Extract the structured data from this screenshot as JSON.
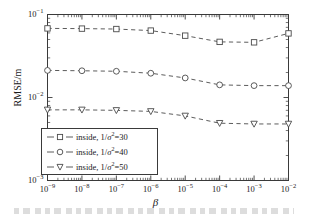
{
  "chart_data": {
    "type": "line",
    "title": "",
    "xlabel": "β",
    "ylabel": "RMSE/m",
    "xscale": "log",
    "yscale": "log",
    "xlim": [
      1e-09,
      0.01
    ],
    "ylim": [
      0.001,
      0.1
    ],
    "grid": false,
    "legend_position": "lower-left-inside",
    "x": [
      1e-09,
      1e-08,
      1e-07,
      1e-06,
      1e-05,
      0.0001,
      0.001,
      0.01
    ],
    "xtick_labels": [
      "10−9",
      "10−8",
      "10−7",
      "10−6",
      "10−5",
      "10−4",
      "10−3",
      "10−2"
    ],
    "ytick_labels": [
      "10−1",
      "10−2",
      "10−3"
    ],
    "ytick_values": [
      0.1,
      0.01,
      0.001
    ],
    "series": [
      {
        "name": "inside, 1/σ²=30",
        "marker": "square",
        "linestyle": "dashed",
        "color": "#3a3a3a",
        "values": [
          0.068,
          0.0676,
          0.0668,
          0.064,
          0.0556,
          0.0468,
          0.0462,
          0.0592
        ]
      },
      {
        "name": "inside, 1/σ²=40",
        "marker": "circle",
        "linestyle": "dashed",
        "color": "#3a3a3a",
        "values": [
          0.0212,
          0.021,
          0.0207,
          0.0196,
          0.0172,
          0.0142,
          0.0139,
          0.0139
        ]
      },
      {
        "name": "inside, 1/σ²=50",
        "marker": "triangle-down",
        "linestyle": "dashed",
        "color": "#3a3a3a",
        "values": [
          0.0071,
          0.0071,
          0.007,
          0.0068,
          0.006,
          0.0049,
          0.0048,
          0.0048
        ]
      }
    ]
  },
  "axes": {
    "ylabel": "RMSE/m",
    "xlabel": "β"
  },
  "legend": {
    "entries": [
      {
        "label_prefix": "inside, 1/",
        "sigma": "σ",
        "exp": "2",
        "eq": "=",
        "value": "30",
        "marker": "square"
      },
      {
        "label_prefix": "inside, 1/",
        "sigma": "σ",
        "exp": "2",
        "eq": "=",
        "value": "40",
        "marker": "circle"
      },
      {
        "label_prefix": "inside, 1/",
        "sigma": "σ",
        "exp": "2",
        "eq": "=",
        "value": "50",
        "marker": "triangle-down"
      }
    ]
  },
  "colors": {
    "axis": "#3a3a3a",
    "line": "#4a4a4a",
    "marker_face": "#ffffff",
    "text": "#1a1a1a",
    "background": "#ffffff"
  }
}
